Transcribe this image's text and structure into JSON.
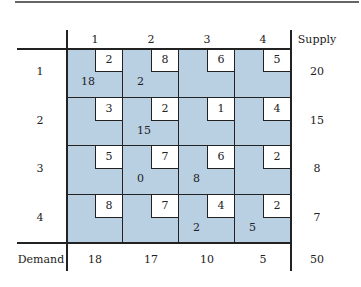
{
  "table": {
    "columns": [
      "1",
      "2",
      "3",
      "4"
    ],
    "supply_label": "Supply",
    "demand_label": "Demand",
    "rows": [
      {
        "label": "1",
        "supply": "20",
        "cells": [
          {
            "cost": "2",
            "alloc": "18"
          },
          {
            "cost": "8",
            "alloc": "2"
          },
          {
            "cost": "6",
            "alloc": ""
          },
          {
            "cost": "5",
            "alloc": ""
          }
        ]
      },
      {
        "label": "2",
        "supply": "15",
        "cells": [
          {
            "cost": "3",
            "alloc": ""
          },
          {
            "cost": "2",
            "alloc": "15"
          },
          {
            "cost": "1",
            "alloc": ""
          },
          {
            "cost": "4",
            "alloc": ""
          }
        ]
      },
      {
        "label": "3",
        "supply": "8",
        "cells": [
          {
            "cost": "5",
            "alloc": ""
          },
          {
            "cost": "7",
            "alloc": "0"
          },
          {
            "cost": "6",
            "alloc": "8"
          },
          {
            "cost": "2",
            "alloc": ""
          }
        ]
      },
      {
        "label": "4",
        "supply": "7",
        "cells": [
          {
            "cost": "8",
            "alloc": ""
          },
          {
            "cost": "7",
            "alloc": ""
          },
          {
            "cost": "4",
            "alloc": "2"
          },
          {
            "cost": "2",
            "alloc": "5"
          }
        ]
      }
    ],
    "demand": [
      "18",
      "17",
      "10",
      "5"
    ],
    "total": "50"
  },
  "colors": {
    "cell_fill": "#b9cfe2",
    "cost_box": "#ffffff",
    "lines": "#222222"
  }
}
